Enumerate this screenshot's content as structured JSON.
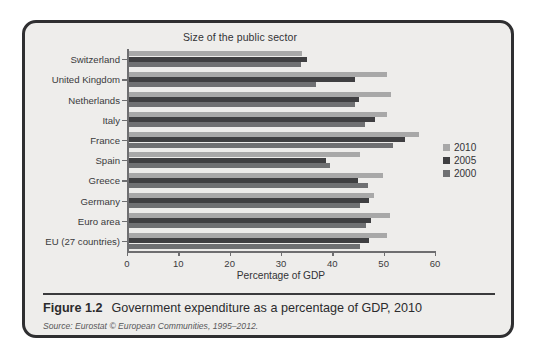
{
  "figure": {
    "number_label": "Figure 1.2",
    "caption": "Government expenditure as a percentage of GDP, 2010",
    "source": "Source: Eurostat © European Communities, 1995–2012."
  },
  "legend": {
    "items": [
      {
        "label": "2010",
        "color": "#a8a8a8"
      },
      {
        "label": "2005",
        "color": "#3f3f41"
      },
      {
        "label": "2000",
        "color": "#6f7072"
      }
    ]
  },
  "chart_data": {
    "type": "bar",
    "orientation": "horizontal",
    "title": "Size of the public sector",
    "xlabel": "Percentage of GDP",
    "ylabel": "",
    "xlim": [
      0,
      60
    ],
    "xticks": [
      0,
      10,
      20,
      30,
      40,
      50,
      60
    ],
    "grid": false,
    "legend_position": "right",
    "categories": [
      "Switzerland",
      "United Kingdom",
      "Netherlands",
      "Italy",
      "France",
      "Spain",
      "Greece",
      "Germany",
      "Euro area",
      "EU (27 countries)"
    ],
    "series": [
      {
        "name": "2010",
        "color": "#a8a8a8",
        "values": [
          33.7,
          50.3,
          51.2,
          50.3,
          56.6,
          45.0,
          49.5,
          47.9,
          50.9,
          50.3
        ]
      },
      {
        "name": "2005",
        "color": "#3f3f41",
        "values": [
          34.7,
          44.2,
          44.8,
          48.0,
          53.9,
          38.4,
          44.6,
          46.9,
          47.3,
          46.9
        ]
      },
      {
        "name": "2000",
        "color": "#6f7072",
        "values": [
          33.5,
          36.6,
          44.2,
          46.1,
          51.6,
          39.2,
          46.7,
          45.1,
          46.2,
          45.1
        ]
      }
    ]
  }
}
